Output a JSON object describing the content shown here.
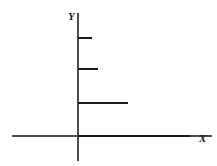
{
  "figure": {
    "title": "",
    "background_color": "#ffffff",
    "width": 217,
    "height": 166
  },
  "axes": {
    "x_axis": {
      "label": "X",
      "name": "x-axis",
      "color": "#4d4d4d",
      "stroke_width": 1.2,
      "start_px": 12,
      "end_px": 212,
      "y_px": 136
    },
    "y_axis": {
      "label": "Y",
      "name": "y-axis",
      "color": "#4d4d4d",
      "stroke_width": 1.2,
      "top_px": 13,
      "bottom_px": 161,
      "x_px": 78
    },
    "origin": {
      "x_px": 78,
      "y_px": 136
    }
  },
  "chart_data": {
    "type": "line",
    "subtype": "step",
    "title": "",
    "xlabel": "X",
    "ylabel": "Y",
    "grid": false,
    "legend": false,
    "legend_position": "none",
    "xlim": [
      0,
      4
    ],
    "ylim": [
      0,
      4
    ],
    "axis_ticks": {
      "x": [],
      "y": []
    },
    "series": [
      {
        "name": "step-function",
        "color": "#1a1a1a",
        "stroke_width": 2.2,
        "description": "Descending staircase: four horizontal treads of increasing length, each starting at the Y axis; no vertical risers drawn.",
        "steps": [
          {
            "index": 1,
            "y_value": 4,
            "x_start": 0,
            "x_end": 0.28,
            "y_px": 38,
            "x_start_px": 78,
            "x_end_px": 92
          },
          {
            "index": 2,
            "y_value": 3,
            "x_start": 0,
            "x_end": 0.4,
            "y_px": 69,
            "x_start_px": 78,
            "x_end_px": 98
          },
          {
            "index": 3,
            "y_value": 2,
            "x_start": 0,
            "x_end": 1.0,
            "y_px": 103,
            "x_start_px": 78,
            "x_end_px": 128
          },
          {
            "index": 4,
            "y_value": 0,
            "x_start": 0,
            "x_end": 2.24,
            "y_px": 136,
            "x_start_px": 78,
            "x_end_px": 190
          }
        ]
      }
    ]
  },
  "colors": {
    "axis": "#4d4d4d",
    "data": "#1a1a1a",
    "background": "#ffffff"
  }
}
